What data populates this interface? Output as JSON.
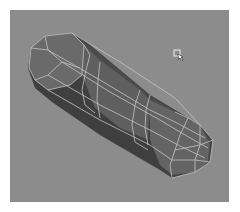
{
  "viewport": {
    "name": "3D Perspective Viewport",
    "background_color": "#8c8c8c",
    "object": {
      "type": "capsule-mesh",
      "display": "shaded-wireframe",
      "face_color": "#5e5e5e",
      "dark_face_color": "#3e3e3e",
      "wire_color": "#c8c8c8"
    },
    "cursor": {
      "icon": "arrow-pointer-icon"
    }
  }
}
